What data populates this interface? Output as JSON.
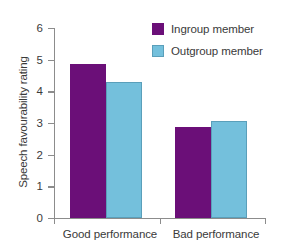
{
  "chart_data": {
    "type": "bar",
    "title": "",
    "xlabel": "",
    "ylabel": "Speech favourability rating",
    "categories": [
      "Good performance",
      "Bad performance"
    ],
    "series": [
      {
        "name": "Ingroup member",
        "color": "#6b0f78",
        "values": [
          4.87,
          2.87
        ]
      },
      {
        "name": "Outgroup member",
        "color": "#74c0dc",
        "values": [
          4.3,
          3.06
        ]
      }
    ],
    "ylim": [
      0,
      6
    ],
    "yticks": [
      "0",
      "1",
      "2",
      "3",
      "4",
      "5",
      "6"
    ],
    "grid": false,
    "legend_position": "top-right"
  },
  "legend": {
    "entries": [
      {
        "label": "Ingroup member",
        "swatch": "purple-swatch"
      },
      {
        "label": "Outgroup member",
        "swatch": "blue-swatch"
      }
    ]
  },
  "axes": {
    "y_title": "Speech favourability rating",
    "y_tick_labels": [
      "6",
      "5",
      "4",
      "3",
      "2",
      "1",
      "0"
    ],
    "x_tick_labels": [
      "Good performance",
      "Bad performance"
    ]
  },
  "top_crop_text": ""
}
